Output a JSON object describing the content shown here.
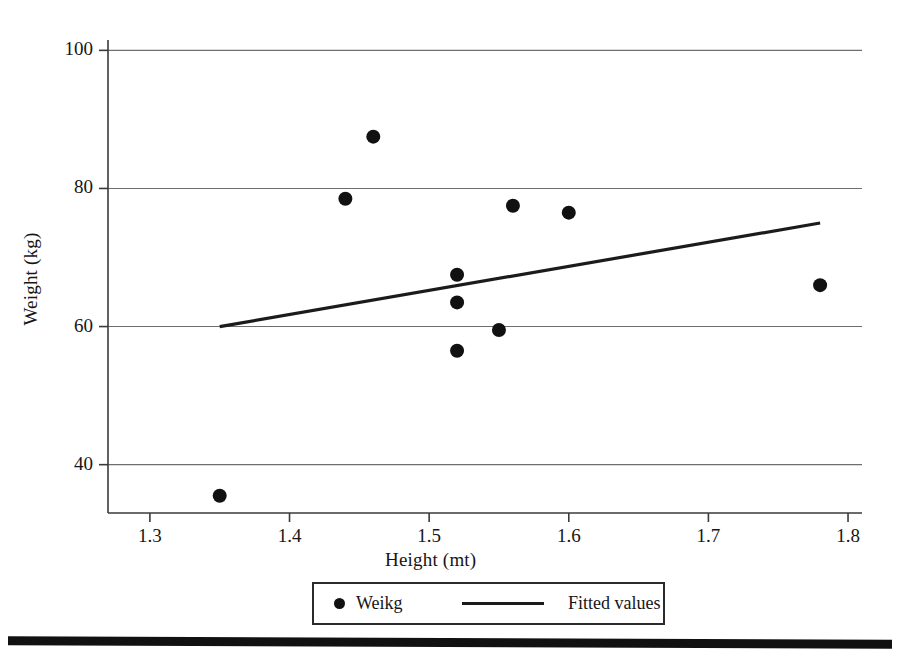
{
  "chart_data": {
    "type": "scatter",
    "title": "",
    "xlabel": "Height (mt)",
    "ylabel": "Weight (kg)",
    "xlim": [
      1.27,
      1.81
    ],
    "ylim": [
      33.0,
      101.5
    ],
    "xticks": [
      "1.3",
      "1.4",
      "1.5",
      "1.6",
      "1.7",
      "1.8"
    ],
    "xtick_values": [
      1.3,
      1.4,
      1.5,
      1.6,
      1.7,
      1.8
    ],
    "yticks": [
      "40",
      "60",
      "80",
      "100"
    ],
    "ytick_values": [
      40,
      60,
      80,
      100
    ],
    "grid": "horizontal",
    "legend_position": "below-axes",
    "series": [
      {
        "name": "Weikg",
        "type": "scatter",
        "marker": "filled-circle",
        "color": "#111111",
        "points": [
          {
            "x": 1.35,
            "y": 35.5
          },
          {
            "x": 1.44,
            "y": 78.5
          },
          {
            "x": 1.46,
            "y": 87.5
          },
          {
            "x": 1.52,
            "y": 67.5
          },
          {
            "x": 1.52,
            "y": 63.5
          },
          {
            "x": 1.52,
            "y": 56.5
          },
          {
            "x": 1.55,
            "y": 59.5
          },
          {
            "x": 1.56,
            "y": 77.5
          },
          {
            "x": 1.6,
            "y": 76.5
          },
          {
            "x": 1.78,
            "y": 66.0
          }
        ]
      },
      {
        "name": "Fitted values",
        "type": "line",
        "color": "#1b1b1b",
        "points": [
          {
            "x": 1.35,
            "y": 60.0
          },
          {
            "x": 1.78,
            "y": 75.0
          }
        ]
      }
    ]
  },
  "axes": {
    "y_title": "Weight (kg)",
    "x_title": "Height (mt)"
  },
  "legend": {
    "scatter_label": "Weikg",
    "line_label": "Fitted values"
  },
  "colors": {
    "marker": "#111111",
    "fit_line": "#1b1b1b",
    "grid": "#6e6e6e",
    "axis": "#3a3a3a",
    "background": "#ffffff"
  }
}
